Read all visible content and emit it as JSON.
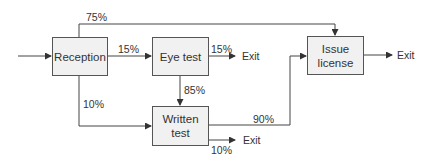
{
  "diagram": {
    "type": "flowchart",
    "nodes": {
      "reception": {
        "label": "Reception"
      },
      "eye_test": {
        "label": "Eye test"
      },
      "written_test": {
        "line1": "Written",
        "line2": "test"
      },
      "issue_license": {
        "line1": "Issue",
        "line2": "license"
      }
    },
    "edges": {
      "reception_to_issue": "75%",
      "reception_to_eye": "15%",
      "eye_to_exit": "15%",
      "eye_to_written": "85%",
      "reception_to_written": "10%",
      "written_to_issue": "90%",
      "written_to_exit": "10%"
    },
    "exits": {
      "eye_exit": "Exit",
      "written_exit": "Exit",
      "issue_exit": "Exit"
    },
    "colors": {
      "box_fill": "#f1f1f1",
      "box_border": "#555555",
      "line": "#333333"
    }
  }
}
